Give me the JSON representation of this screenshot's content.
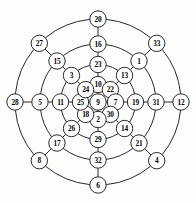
{
  "diagram": {
    "type": "radial-graph",
    "center": {
      "x": 98,
      "y": 102
    },
    "node_radius": 8.2,
    "ring_radii": [
      0,
      17.5,
      37.5,
      58.0,
      83.0
    ],
    "spoke_angles_deg": [
      270,
      315,
      0,
      45,
      90,
      135,
      180,
      225
    ],
    "spoke_names": [
      "N",
      "NE",
      "E",
      "SE",
      "S",
      "SW",
      "W",
      "NW"
    ],
    "colors": {
      "stroke": "#111111",
      "node_fill": "#ffffff",
      "label": "#000000",
      "background": "#fdfdfb"
    },
    "center_node": {
      "label": "9",
      "ring": 0,
      "spoke": "C"
    },
    "rings": [
      {
        "index": 1,
        "radius": 17.5,
        "nodes": [
          {
            "label": "10",
            "spoke": "N"
          },
          {
            "label": "22",
            "spoke": "NE"
          },
          {
            "label": "7",
            "spoke": "E"
          },
          {
            "label": "30",
            "spoke": "SE"
          },
          {
            "label": "2",
            "spoke": "S"
          },
          {
            "label": "18",
            "spoke": "SW"
          },
          {
            "label": "25",
            "spoke": "W"
          },
          {
            "label": "24",
            "spoke": "NW"
          }
        ]
      },
      {
        "index": 2,
        "radius": 37.5,
        "nodes": [
          {
            "label": "23",
            "spoke": "N"
          },
          {
            "label": "13",
            "spoke": "NE"
          },
          {
            "label": "19",
            "spoke": "E"
          },
          {
            "label": "14",
            "spoke": "SE"
          },
          {
            "label": "29",
            "spoke": "S"
          },
          {
            "label": "26",
            "spoke": "SW"
          },
          {
            "label": "11",
            "spoke": "W"
          },
          {
            "label": "3",
            "spoke": "NW"
          }
        ]
      },
      {
        "index": 3,
        "radius": 58.0,
        "nodes": [
          {
            "label": "16",
            "spoke": "N"
          },
          {
            "label": "1",
            "spoke": "NE"
          },
          {
            "label": "31",
            "spoke": "E"
          },
          {
            "label": "21",
            "spoke": "SE"
          },
          {
            "label": "32",
            "spoke": "S"
          },
          {
            "label": "17",
            "spoke": "SW"
          },
          {
            "label": "5",
            "spoke": "W"
          },
          {
            "label": "15",
            "spoke": "NW"
          }
        ]
      },
      {
        "index": 4,
        "radius": 83.0,
        "nodes": [
          {
            "label": "20",
            "spoke": "N"
          },
          {
            "label": "33",
            "spoke": "NE"
          },
          {
            "label": "12",
            "spoke": "E"
          },
          {
            "label": "4",
            "spoke": "SE"
          },
          {
            "label": "6",
            "spoke": "S"
          },
          {
            "label": "8",
            "spoke": "SW"
          },
          {
            "label": "28",
            "spoke": "W"
          },
          {
            "label": "27",
            "spoke": "NW"
          }
        ]
      }
    ],
    "all_labels": [
      "9",
      "10",
      "22",
      "7",
      "30",
      "2",
      "18",
      "25",
      "24",
      "23",
      "13",
      "19",
      "14",
      "29",
      "26",
      "11",
      "3",
      "16",
      "1",
      "31",
      "21",
      "32",
      "17",
      "5",
      "15",
      "20",
      "33",
      "12",
      "4",
      "6",
      "8",
      "28",
      "27"
    ]
  }
}
